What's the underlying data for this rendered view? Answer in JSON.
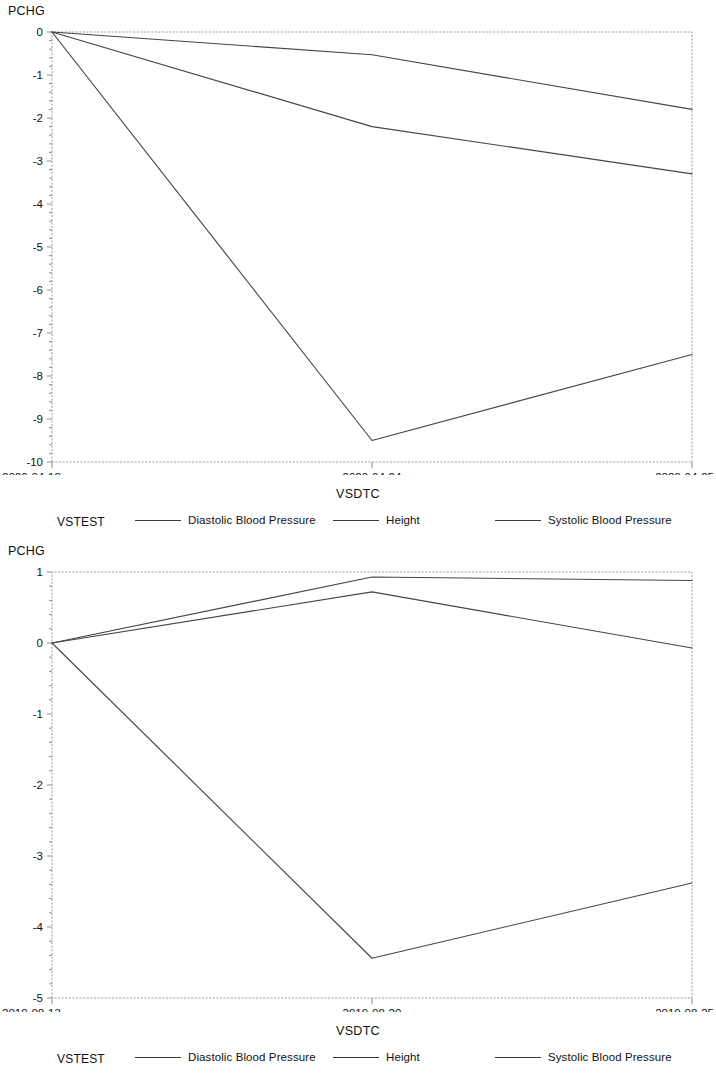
{
  "page": {
    "background": "#ffffff",
    "line_color": "#454545",
    "frame_color": "#9a9a9a"
  },
  "panels": [
    {
      "id": "top",
      "y_axis_title": "PCHG",
      "x_axis_title": "VSDTC",
      "legend_label": "VSTEST"
    },
    {
      "id": "bottom",
      "y_axis_title": "PCHG",
      "x_axis_title": "VSDTC",
      "legend_label": "VSTEST"
    }
  ],
  "chart_data": [
    {
      "type": "line",
      "title": "",
      "subtitle": "",
      "xlabel": "VSDTC",
      "ylabel": "PCHG",
      "x": [
        "2020-04-18",
        "2020-04-24",
        "2020-04-25"
      ],
      "categories": [
        "2020-04-18",
        "2020-04-24",
        "2020-04-25"
      ],
      "xtick_labels": [
        "2020-04-18",
        "2020-04-24",
        "2020-04-25"
      ],
      "ytick_labels": [
        "0",
        "-1",
        "-2",
        "-3",
        "-4",
        "-5",
        "-6",
        "-7",
        "-8",
        "-9",
        "-10"
      ],
      "yticks": [
        0,
        -1,
        -2,
        -3,
        -4,
        -5,
        -6,
        -7,
        -8,
        -9,
        -10
      ],
      "ylim": [
        -10,
        0
      ],
      "xlim": [
        0,
        1
      ],
      "grid": false,
      "legend_position": "bottom",
      "legend_title": "VSTEST",
      "series": [
        {
          "name": "Height",
          "values": [
            0,
            -0.53,
            -1.8
          ]
        },
        {
          "name": "Diastolic Blood Pressure",
          "values": [
            0,
            -2.2,
            -3.3
          ]
        },
        {
          "name": "Systolic Blood Pressure",
          "values": [
            0,
            -9.5,
            -7.5
          ]
        }
      ]
    },
    {
      "type": "line",
      "title": "",
      "subtitle": "",
      "xlabel": "VSDTC",
      "ylabel": "PCHG",
      "x": [
        "2019-08-13",
        "2019-08-20",
        "2019-08-25"
      ],
      "categories": [
        "2019-08-13",
        "2019-08-20",
        "2019-08-25"
      ],
      "xtick_labels": [
        "2019-08-13",
        "2019-08-20",
        "2019-08-25"
      ],
      "ytick_labels": [
        "1",
        "0",
        "-1",
        "-2",
        "-3",
        "-4",
        "-5"
      ],
      "yticks": [
        1,
        0,
        -1,
        -2,
        -3,
        -4,
        -5
      ],
      "ylim": [
        -5,
        1
      ],
      "xlim": [
        0,
        1
      ],
      "grid": false,
      "legend_position": "bottom",
      "legend_title": "VSTEST",
      "series": [
        {
          "name": "Height",
          "values": [
            0,
            0.93,
            0.88
          ]
        },
        {
          "name": "Diastolic Blood Pressure",
          "values": [
            0,
            0.72,
            -0.07
          ]
        },
        {
          "name": "Systolic Blood Pressure",
          "values": [
            0,
            -4.44,
            -3.38
          ]
        }
      ]
    }
  ],
  "legend_entries": [
    {
      "name": "Diastolic Blood Pressure"
    },
    {
      "name": "Height"
    },
    {
      "name": "Systolic Blood Pressure"
    }
  ]
}
